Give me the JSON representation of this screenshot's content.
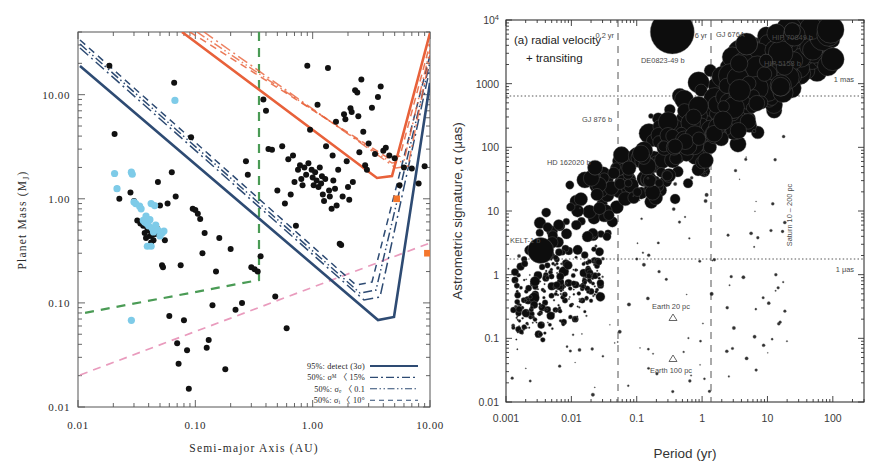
{
  "figure": {
    "panels": [
      "left-detection-limits",
      "right-astrometric-signature"
    ]
  },
  "left_panel": {
    "xlabel": "Semi-major Axis (AU)",
    "ylabel": "Planet Mass (Mⱼ)",
    "ylabel_main": "Planet Mass (M",
    "ylabel_sub": "J",
    "ylabel_end": ")",
    "xticks": [
      "0.01",
      "0.10",
      "1.00",
      "10.00"
    ],
    "yticks": [
      "0.01",
      "0.10",
      "1.00",
      "10.00"
    ],
    "legend": [
      {
        "label": "95%: detect (3σ)",
        "style": "solid"
      },
      {
        "label": "50%: σₘ 〈 15%",
        "style": "dash-dot"
      },
      {
        "label": "50%: σₑ 〈 0.1",
        "style": "dash-dot-dot"
      },
      {
        "label": "50%: σᵢ 〈 10°",
        "style": "dashed"
      }
    ],
    "legend_rows": [
      {
        "pct": "95%:",
        "sym": "detect (3σ)",
        "lim": ""
      },
      {
        "pct": "50%:",
        "sym": "σᴹ 〈",
        "lim": "15%"
      },
      {
        "pct": "50%:",
        "sym": "σₑ 〈",
        "lim": "0.1"
      },
      {
        "pct": "50%:",
        "sym": "σᵢ 〈",
        "lim": "10°"
      }
    ],
    "colors": {
      "detection_blue": "#2e4b73",
      "detection_orange": "#e8613a",
      "green_dashed": "#4a9b55",
      "pink_dashed": "#e99bbd",
      "blue_points": "#7ecbe8",
      "black_points": "#111111",
      "solar_markers": "#f4762c"
    }
  },
  "right_panel": {
    "xlabel": "Period (yr)",
    "ylabel": "Astrometric signature, α (μas)",
    "xticks": [
      "0.001",
      "0.01",
      "0.1",
      "1",
      "10",
      "100"
    ],
    "yticks": [
      "10⁴",
      "1000",
      "100",
      "10",
      "1",
      "0.1",
      "0.01"
    ],
    "panel_title_line1": "(a) radial velocity",
    "panel_title_line2": "+ transiting",
    "annotations": [
      {
        "name": "period-0p2yr",
        "text": "0.2 yr"
      },
      {
        "name": "period-6yr",
        "text": "6 yr"
      },
      {
        "name": "one-mas",
        "text": "1 mas"
      },
      {
        "name": "one-muas",
        "text": "1 μas"
      },
      {
        "name": "saturn-range",
        "text": "Saturn 10 – 200 pc"
      },
      {
        "name": "earth-20pc",
        "text": "Earth 20 pc"
      },
      {
        "name": "earth-100pc",
        "text": "Earth 100 pc"
      }
    ],
    "object_labels": [
      {
        "name": "de0823-49b",
        "text": "DE0823-49 b"
      },
      {
        "name": "gj676a",
        "text": "GJ 676A"
      },
      {
        "name": "hip70849b",
        "text": "HIP 70849 b"
      },
      {
        "name": "hip5158b",
        "text": "HIP 5158 b"
      },
      {
        "name": "gj876b",
        "text": "GJ 876 b"
      },
      {
        "name": "hd162020b",
        "text": "HD 162020 b"
      },
      {
        "name": "kelt1b",
        "text": "KELT-1 b"
      }
    ]
  },
  "chart_data": [
    {
      "id": "left",
      "type": "scatter",
      "title": "",
      "xlabel": "Semi-major Axis (AU)",
      "ylabel": "Planet Mass (M_J)",
      "xscale": "log",
      "yscale": "log",
      "xlim": [
        0.01,
        10.0
      ],
      "ylim": [
        0.01,
        40.0
      ],
      "grid": false,
      "legend_position": "lower-right",
      "series": [
        {
          "name": "known planets (black)",
          "marker": "filled-circle",
          "color": "#111111",
          "points": [
            [
              0.0185,
              19.0
            ],
            [
              0.0205,
              4.2
            ],
            [
              0.0215,
              1.25
            ],
            [
              0.0225,
              1.0
            ],
            [
              0.028,
              1.15
            ],
            [
              0.03,
              0.95
            ],
            [
              0.032,
              0.62
            ],
            [
              0.034,
              0.58
            ],
            [
              0.036,
              0.55
            ],
            [
              0.037,
              0.47
            ],
            [
              0.038,
              0.42
            ],
            [
              0.039,
              0.52
            ],
            [
              0.04,
              0.5
            ],
            [
              0.041,
              0.44
            ],
            [
              0.042,
              0.38
            ],
            [
              0.043,
              0.45
            ],
            [
              0.044,
              0.4
            ],
            [
              0.0455,
              0.5
            ],
            [
              0.046,
              0.46
            ],
            [
              0.047,
              0.52
            ],
            [
              0.048,
              1.45
            ],
            [
              0.05,
              0.86
            ],
            [
              0.052,
              0.23
            ],
            [
              0.053,
              0.22
            ],
            [
              0.055,
              0.4
            ],
            [
              0.058,
              0.9
            ],
            [
              0.06,
              0.075
            ],
            [
              0.063,
              1.8
            ],
            [
              0.066,
              13.0
            ],
            [
              0.068,
              1.05
            ],
            [
              0.07,
              0.041
            ],
            [
              0.072,
              0.026
            ],
            [
              0.075,
              0.23
            ],
            [
              0.08,
              0.068
            ],
            [
              0.085,
              0.035
            ],
            [
              0.088,
              0.015
            ],
            [
              0.092,
              3.9
            ],
            [
              0.095,
              0.8
            ],
            [
              0.1,
              0.78
            ],
            [
              0.105,
              0.72
            ],
            [
              0.11,
              0.64
            ],
            [
              0.115,
              0.3
            ],
            [
              0.12,
              0.47
            ],
            [
              0.125,
              0.037
            ],
            [
              0.13,
              0.044
            ],
            [
              0.14,
              0.095
            ],
            [
              0.15,
              0.2
            ],
            [
              0.16,
              0.42
            ],
            [
              0.18,
              0.023
            ],
            [
              0.2,
              0.33
            ],
            [
              0.22,
              0.086
            ],
            [
              0.25,
              0.1
            ],
            [
              0.27,
              2.3
            ],
            [
              0.28,
              1.7
            ],
            [
              0.3,
              0.22
            ],
            [
              0.32,
              0.21
            ],
            [
              0.34,
              0.2
            ],
            [
              0.36,
              0.28
            ],
            [
              0.38,
              9.0
            ],
            [
              0.4,
              7.0
            ],
            [
              0.42,
              3.0
            ],
            [
              0.45,
              2.95
            ],
            [
              0.48,
              0.115
            ],
            [
              0.5,
              1.2
            ],
            [
              0.55,
              3.2
            ],
            [
              0.58,
              0.9
            ],
            [
              0.6,
              0.057
            ],
            [
              0.62,
              2.4
            ],
            [
              0.65,
              1.1
            ],
            [
              0.68,
              2.6
            ],
            [
              0.7,
              1.45
            ],
            [
              0.72,
              0.55
            ],
            [
              0.75,
              1.9
            ],
            [
              0.78,
              2.1
            ],
            [
              0.8,
              1.55
            ],
            [
              0.82,
              1.35
            ],
            [
              0.85,
              2.0
            ],
            [
              0.88,
              1.7
            ],
            [
              0.9,
              19.0
            ],
            [
              0.92,
              2.2
            ],
            [
              0.95,
              4.6
            ],
            [
              0.98,
              1.9
            ],
            [
              1.0,
              1.6
            ],
            [
              1.02,
              1.35
            ],
            [
              1.05,
              1.8
            ],
            [
              1.08,
              1.5
            ],
            [
              1.1,
              8.0
            ],
            [
              1.12,
              1.3
            ],
            [
              1.15,
              2.0
            ],
            [
              1.18,
              1.4
            ],
            [
              1.2,
              1.65
            ],
            [
              1.22,
              1.1
            ],
            [
              1.25,
              0.95
            ],
            [
              1.28,
              1.55
            ],
            [
              1.3,
              3.2
            ],
            [
              1.35,
              18.0
            ],
            [
              1.38,
              1.2
            ],
            [
              1.4,
              1.05
            ],
            [
              1.45,
              0.8
            ],
            [
              1.48,
              2.6
            ],
            [
              1.5,
              1.5
            ],
            [
              1.55,
              1.25
            ],
            [
              1.58,
              5.5
            ],
            [
              1.6,
              0.86
            ],
            [
              1.65,
              1.9
            ],
            [
              1.7,
              0.37
            ],
            [
              1.75,
              0.36
            ],
            [
              1.8,
              1.05
            ],
            [
              1.85,
              6.5
            ],
            [
              1.9,
              5.8
            ],
            [
              1.95,
              2.3
            ],
            [
              2.0,
              1.3
            ],
            [
              2.05,
              0.98
            ],
            [
              2.1,
              7.4
            ],
            [
              2.15,
              6.8
            ],
            [
              2.2,
              1.45
            ],
            [
              2.3,
              11.0
            ],
            [
              2.4,
              10.5
            ],
            [
              2.45,
              6.2
            ],
            [
              2.5,
              2.8
            ],
            [
              2.6,
              14.0
            ],
            [
              2.7,
              4.4
            ],
            [
              2.8,
              2.1
            ],
            [
              2.9,
              1.9
            ],
            [
              3.0,
              3.4
            ],
            [
              3.2,
              7.5
            ],
            [
              3.4,
              2.7
            ],
            [
              3.6,
              9.5
            ],
            [
              3.8,
              12.0
            ],
            [
              4.0,
              2.9
            ],
            [
              4.2,
              3.1
            ],
            [
              4.5,
              2.6
            ],
            [
              5.0,
              2.45
            ],
            [
              5.5,
              1.35
            ],
            [
              6.0,
              2.0
            ],
            [
              7.0,
              1.95
            ],
            [
              8.0,
              1.4
            ],
            [
              9.0,
              2.05
            ]
          ]
        },
        {
          "name": "transiting subset (light blue)",
          "marker": "filled-circle",
          "color": "#7ecbe8",
          "points": [
            [
              0.0205,
              1.75
            ],
            [
              0.0215,
              1.25
            ],
            [
              0.0285,
              1.8
            ],
            [
              0.029,
              1.72
            ],
            [
              0.03,
              0.93
            ],
            [
              0.031,
              0.9
            ],
            [
              0.0335,
              0.85
            ],
            [
              0.0345,
              0.8
            ],
            [
              0.036,
              0.62
            ],
            [
              0.037,
              0.6
            ],
            [
              0.038,
              0.68
            ],
            [
              0.0385,
              0.58
            ],
            [
              0.04,
              0.55
            ],
            [
              0.041,
              0.63
            ],
            [
              0.042,
              0.9
            ],
            [
              0.043,
              0.52
            ],
            [
              0.044,
              0.48
            ],
            [
              0.045,
              0.86
            ],
            [
              0.046,
              0.56
            ],
            [
              0.048,
              0.5
            ],
            [
              0.05,
              0.44
            ],
            [
              0.052,
              0.47
            ],
            [
              0.054,
              0.49
            ],
            [
              0.0285,
              0.068
            ],
            [
              0.067,
              8.8
            ],
            [
              0.039,
              0.35
            ],
            [
              0.042,
              0.35
            ]
          ]
        },
        {
          "name": "solar system (Jupiter, Saturn)",
          "marker": "filled-square",
          "color": "#f4762c",
          "points": [
            [
              5.2,
              1.0
            ],
            [
              9.5,
              0.3
            ]
          ]
        }
      ],
      "curves": [
        {
          "name": "95%: detect (3σ) – blue",
          "style": "solid",
          "color": "#2e4b73"
        },
        {
          "name": "50%: σ_M < 15% – blue",
          "style": "dash-dot",
          "color": "#2e4b73"
        },
        {
          "name": "50%: σ_e < 0.1 – blue",
          "style": "dash-dot-dot",
          "color": "#2e4b73"
        },
        {
          "name": "50%: σ_i < 10° – blue",
          "style": "dashed",
          "color": "#2e4b73"
        },
        {
          "name": "95%: detect (3σ) – orange",
          "style": "solid",
          "color": "#e8613a"
        },
        {
          "name": "50%: σ_M < 15% – orange",
          "style": "dash-dot",
          "color": "#e8613a"
        },
        {
          "name": "50%: σ_e < 0.1 – orange",
          "style": "dash-dot-dot",
          "color": "#e8613a"
        },
        {
          "name": "50%: σ_i < 10° – orange",
          "style": "dashed",
          "color": "#e8613a"
        },
        {
          "name": "green dashed boundary",
          "style": "dashed",
          "color": "#4a9b55"
        },
        {
          "name": "pink dashed boundary",
          "style": "dashed",
          "color": "#e99bbd"
        }
      ]
    },
    {
      "id": "right",
      "type": "scatter",
      "title": "(a) radial velocity + transiting",
      "xlabel": "Period (yr)",
      "ylabel": "Astrometric signature, α (μas)",
      "xscale": "log",
      "yscale": "log",
      "xlim": [
        0.001,
        300
      ],
      "ylim": [
        0.01,
        10000
      ],
      "grid": false,
      "marker": "filled-circle-variable-size",
      "size_encodes": "planet mass / distance",
      "reference_lines": [
        {
          "name": "1 mas",
          "orientation": "horizontal",
          "value": 1000,
          "style": "dotted"
        },
        {
          "name": "1 μas",
          "orientation": "horizontal",
          "value": 1,
          "style": "dotted"
        },
        {
          "name": "0.2 yr",
          "orientation": "vertical",
          "value": 0.2,
          "style": "dashed"
        },
        {
          "name": "6 yr",
          "orientation": "vertical",
          "value": 6,
          "style": "dashed"
        }
      ],
      "highlighted_points": [
        {
          "label": "DE0823-49 b",
          "x": 0.35,
          "y": 6500,
          "size": 44
        },
        {
          "label": "GJ 676A",
          "x": 4.8,
          "y": 4200,
          "size": 22
        },
        {
          "label": "HIP 70849 b",
          "x": 24.0,
          "y": 6800,
          "size": 16
        },
        {
          "label": "HIP 5158 b",
          "x": 9.5,
          "y": 2300,
          "size": 13
        },
        {
          "label": "GJ 876 b",
          "x": 0.165,
          "y": 310,
          "size": 5
        },
        {
          "label": "HD 162020 b",
          "x": 0.023,
          "y": 48,
          "size": 15
        },
        {
          "label": "KELT-1 b",
          "x": 0.0034,
          "y": 2.4,
          "size": 26
        }
      ],
      "triangle_markers": [
        {
          "label": "Earth 20 pc",
          "x": 1.0,
          "y": 0.16
        },
        {
          "label": "Earth 100 pc",
          "x": 1.0,
          "y": 0.032
        }
      ]
    }
  ]
}
